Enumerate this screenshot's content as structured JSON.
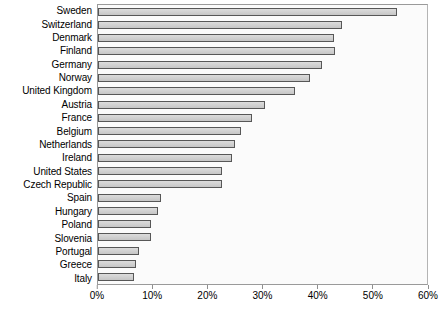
{
  "chart_data": {
    "type": "bar",
    "orientation": "horizontal",
    "title": "",
    "subtitle": "",
    "xlabel": "",
    "ylabel": "",
    "xlim": [
      0,
      60
    ],
    "ylim": null,
    "grid": false,
    "legend": null,
    "x_tick_labels": [
      "0%",
      "10%",
      "20%",
      "30%",
      "40%",
      "50%",
      "60%"
    ],
    "x_ticks": [
      0,
      10,
      20,
      30,
      40,
      50,
      60
    ],
    "tick_suffix": "%",
    "categories": [
      "Sweden",
      "Switzerland",
      "Denmark",
      "Finland",
      "Germany",
      "Norway",
      "United Kingdom",
      "Austria",
      "France",
      "Belgium",
      "Netherlands",
      "Ireland",
      "United States",
      "Czech Republic",
      "Spain",
      "Hungary",
      "Poland",
      "Slovenia",
      "Portugal",
      "Greece",
      "Italy"
    ],
    "values": [
      54.5,
      44.5,
      43.0,
      43.2,
      40.8,
      38.6,
      35.9,
      30.5,
      28.0,
      26.0,
      25.0,
      24.5,
      22.7,
      22.7,
      11.5,
      11.0,
      9.7,
      9.7,
      7.5,
      7.0,
      6.5
    ],
    "value_labels_visible": false,
    "colors": {
      "bar_fill": "#d2d2d2",
      "bar_border": "#575757",
      "plot_background": "#fbfbfb",
      "plot_border": "#9a9a9a",
      "axis_text": "#000000",
      "tick_mark": "#8f8f8f",
      "page_background": "#ffffff"
    }
  }
}
